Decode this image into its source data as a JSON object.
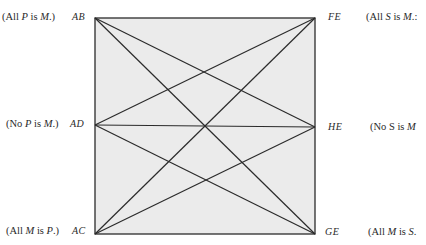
{
  "diagram": {
    "title": "",
    "box": {
      "x": 95,
      "y": 18,
      "width": 220,
      "height": 216,
      "fill": "#ebebeb",
      "stroke": "#2b2b2b"
    },
    "nodes": [
      {
        "id": "AB",
        "label": "AB",
        "x": 95,
        "y": 18,
        "proposition": {
          "q": "All",
          "s": "P",
          "verb": "is",
          "p": "M",
          "end": ".)"
        }
      },
      {
        "id": "FE",
        "label": "FE",
        "x": 315,
        "y": 18,
        "proposition": {
          "q": "All",
          "s": "S",
          "verb": "is",
          "p": "M",
          "end": ".:"
        }
      },
      {
        "id": "AD",
        "label": "AD",
        "x": 95,
        "y": 125,
        "proposition": {
          "q": "No",
          "s": "P",
          "verb": "is",
          "p": "M",
          "end": ".)"
        }
      },
      {
        "id": "HE",
        "label": "HE",
        "x": 315,
        "y": 127,
        "proposition": {
          "q": "No",
          "s": "S",
          "verb": "is",
          "p": "M",
          "end": ""
        }
      },
      {
        "id": "AC",
        "label": "AC",
        "x": 95,
        "y": 234,
        "proposition": {
          "q": "All",
          "s": "M",
          "verb": "is",
          "p": "P",
          "end": ".)"
        }
      },
      {
        "id": "GE",
        "label": "GE",
        "x": 315,
        "y": 234,
        "proposition": {
          "q": "All",
          "s": "M",
          "verb": "is",
          "p": "S",
          "end": "."
        }
      }
    ],
    "center": {
      "x": 204,
      "y": 126
    },
    "edges": [
      [
        "AD",
        "HE"
      ],
      [
        "AB",
        "GE"
      ],
      [
        "FE",
        "AC"
      ],
      [
        "AB",
        "HE"
      ],
      [
        "FE",
        "AD"
      ],
      [
        "AC",
        "HE"
      ],
      [
        "GE",
        "AD"
      ]
    ],
    "labels": {
      "AB": "AB",
      "FE": "FE",
      "AD": "AD",
      "HE": "HE",
      "AC": "AC",
      "GE": "GE",
      "AB_prop": {
        "open": "(All ",
        "s": "P",
        "mid": " is ",
        "p": "M",
        "close": ".)"
      },
      "FE_prop": {
        "open": "(All ",
        "s": "S",
        "mid": " is ",
        "p": "M",
        "close": ".:"
      },
      "AD_prop": {
        "open": "(No ",
        "s": "P",
        "mid": " is ",
        "p": "M",
        "close": ".)"
      },
      "HE_prop": {
        "open": "(No ",
        "s": "S",
        "mid": " is ",
        "p": "M",
        "close": ""
      },
      "AC_prop": {
        "open": "(All ",
        "s": "M",
        "mid": " is ",
        "p": "P",
        "close": ".)"
      },
      "GE_prop": {
        "open": "(All ",
        "s": "M",
        "mid": " is ",
        "p": "S",
        "close": "."
      }
    }
  }
}
